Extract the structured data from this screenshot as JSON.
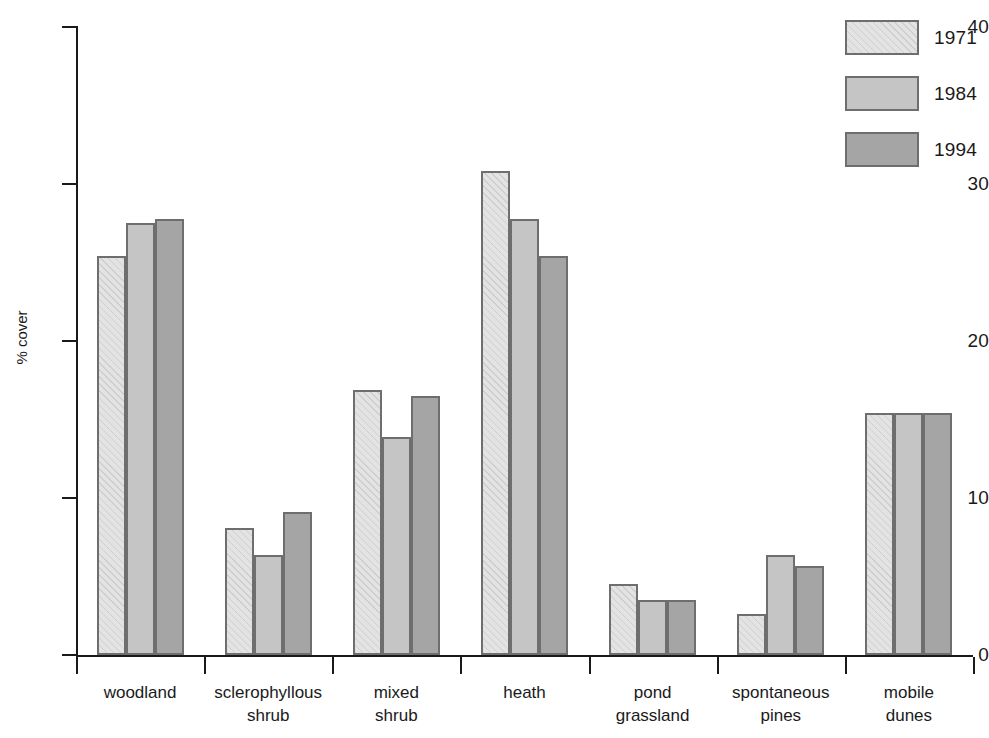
{
  "chart_data": {
    "type": "bar",
    "title": "",
    "xlabel": "",
    "ylabel": "% cover",
    "ylim": [
      0,
      40
    ],
    "ytick_labels": [
      "0",
      "10",
      "20",
      "30",
      "40"
    ],
    "yticks": [
      0,
      10,
      20,
      30,
      40
    ],
    "grid": false,
    "legend_position": "top-right",
    "categories": [
      "woodland",
      "sclerophyllous shrub",
      "mixed shrub",
      "heath",
      "pond grassland",
      "spontaneous pines",
      "mobile dunes"
    ],
    "category_lines": [
      [
        "woodland"
      ],
      [
        "sclerophyllous",
        "shrub"
      ],
      [
        "mixed",
        "shrub"
      ],
      [
        "heath"
      ],
      [
        "pond",
        "grassland"
      ],
      [
        "spontaneous",
        "pines"
      ],
      [
        "mobile",
        "dunes"
      ]
    ],
    "series": [
      {
        "name": "1971",
        "color": "#e3e3e3",
        "hatch": "diagonal",
        "values": [
          25.4,
          8.1,
          16.9,
          30.8,
          4.5,
          2.6,
          15.4
        ]
      },
      {
        "name": "1984",
        "color": "#c5c5c5",
        "hatch": "none",
        "values": [
          27.5,
          6.4,
          13.9,
          27.8,
          3.5,
          6.4,
          15.4
        ]
      },
      {
        "name": "1994",
        "color": "#a5a5a5",
        "hatch": "none",
        "values": [
          27.8,
          9.1,
          16.5,
          25.4,
          3.5,
          5.7,
          15.4
        ]
      }
    ]
  },
  "legend": {
    "entries": [
      {
        "label": "1971"
      },
      {
        "label": "1984"
      },
      {
        "label": "1994"
      }
    ]
  },
  "colors": {
    "series_1971": "#e3e3e3",
    "series_1984": "#c5c5c5",
    "series_1994": "#a5a5a5",
    "bar_outline": "#6e6e6e",
    "axis": "#1a1a1a",
    "background": "#ffffff"
  }
}
